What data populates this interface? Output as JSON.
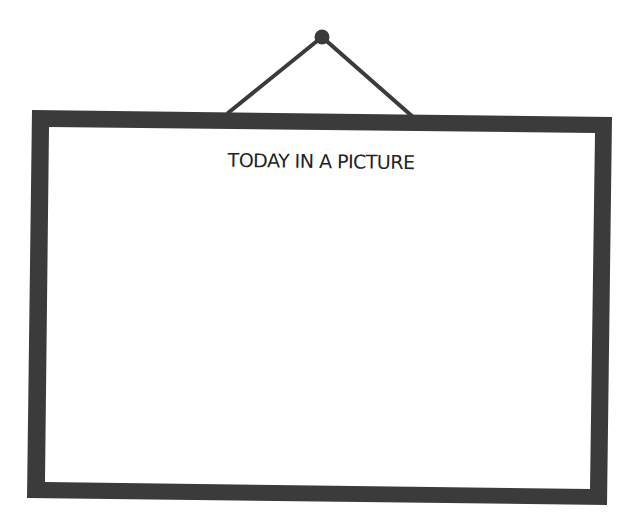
{
  "frame": {
    "title": "TODAY IN A PICTURE",
    "frame_color": "#3b3b3b",
    "canvas_color": "#ffffff",
    "string_color": "#3b3b3b",
    "nail_color": "#3b3b3b",
    "content": ""
  }
}
